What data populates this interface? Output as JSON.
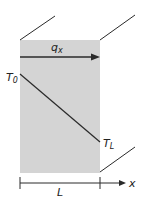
{
  "diagram": {
    "flux_label": "q",
    "flux_subscript": "x",
    "temp_left_label": "T",
    "temp_left_subscript": "0",
    "temp_right_label": "T",
    "temp_right_subscript": "L",
    "length_label": "L",
    "axis_label": "x",
    "colors": {
      "slab_fill": "#d4d4d4",
      "line": "#2a2a2a",
      "background": "#ffffff"
    }
  }
}
